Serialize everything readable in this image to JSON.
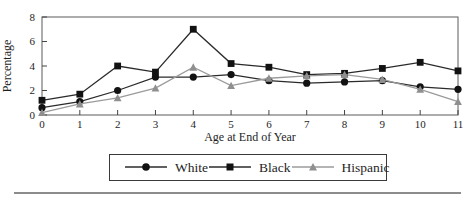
{
  "figure": {
    "colors": {
      "background": "#ffffff",
      "text": "#1e1e1e",
      "plot_border": "#5a5a5a",
      "tick": "#444444",
      "bottom_rule": "#8c8c8c",
      "legend_border": "#3a3a3a"
    }
  },
  "chart_data": {
    "type": "line",
    "title": "",
    "xlabel": "Age at End of Year",
    "ylabel": "Percentage",
    "x": [
      0,
      1,
      2,
      3,
      4,
      5,
      6,
      7,
      8,
      9,
      10,
      11
    ],
    "xticks": [
      "0",
      "1",
      "2",
      "3",
      "4",
      "5",
      "6",
      "7",
      "8",
      "9",
      "10",
      "11"
    ],
    "yticks": [
      "0",
      "2",
      "4",
      "6",
      "8"
    ],
    "ytick_values": [
      0,
      2,
      4,
      6,
      8
    ],
    "ylim": [
      0,
      8
    ],
    "xlim": [
      0,
      11
    ],
    "grid": false,
    "legend_position": "bottom",
    "series": [
      {
        "name": "White",
        "marker": "circle",
        "line_color": "#2b2b2b",
        "marker_color": "#121212",
        "values": [
          0.6,
          1.1,
          2.0,
          3.1,
          3.1,
          3.3,
          2.8,
          2.6,
          2.7,
          2.8,
          2.3,
          2.1
        ]
      },
      {
        "name": "Black",
        "marker": "square",
        "line_color": "#2b2b2b",
        "marker_color": "#121212",
        "values": [
          1.2,
          1.7,
          4.0,
          3.5,
          7.0,
          4.2,
          3.9,
          3.3,
          3.4,
          3.8,
          4.3,
          3.6
        ]
      },
      {
        "name": "Hispanic",
        "marker": "triangle",
        "line_color": "#9b9b9b",
        "marker_color": "#8f8f8f",
        "values": [
          0.2,
          0.9,
          1.4,
          2.2,
          3.9,
          2.4,
          3.0,
          3.2,
          3.3,
          2.9,
          2.1,
          1.1
        ]
      }
    ]
  }
}
